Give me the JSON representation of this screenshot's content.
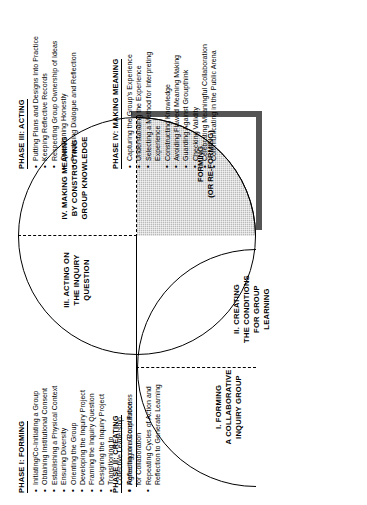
{
  "diagram": {
    "quadrants": [
      {
        "id": "q1",
        "label": "I.  FORMING\nA COLLABORATIVE\nINQUIRY GROUP"
      },
      {
        "id": "q2",
        "label": "II. CREATING\nTHE CONDITIONS\nFOR GROUP\nLEARNING"
      },
      {
        "id": "q3",
        "label": "III. ACTING ON\nTHE INQUIRY\nQUESTION"
      },
      {
        "id": "q4",
        "label": "IV.  MAKING MEANING\nBY CONSTRUCTING\nGROUP KNOWLEDGE"
      }
    ],
    "shaded_region_label": "FORMING\n(OR RE-FORMING)"
  },
  "phases": [
    {
      "id": "phase1",
      "heading": "PHASE I:  FORMING",
      "items": [
        "Initiating/Co-Initiating a Group",
        "Obtaining Institutional Consent",
        "Establishing a Physical Context",
        "Ensuring Diversity",
        "Orienting the Group",
        "Developing the Inquiry Project",
        "Framing the Inquiry Question",
        "Designing the Inquiry Project",
        "Transitioning to",
        "Collective Leadership",
        "Reflecting on Group Process"
      ],
      "continuation_indexes": [
        9
      ]
    },
    {
      "id": "phase2",
      "heading": "PHASE II:  CREATING",
      "items": [
        "Agreeing on a Constitution",
        "for Collaboration",
        "Repeating Cycles of Action and",
        "Reflection to Generate Learning"
      ],
      "continuation_indexes": [
        1,
        3
      ]
    },
    {
      "id": "phase3",
      "heading": "PHASE III:  ACTING",
      "items": [
        "Putting Plans and Designs Into Practice",
        "Keeping Reflective Records",
        "Respecting Group Ownership of Ideas",
        "Questioning Honestly",
        "Practicing Dialogue and Reflection"
      ],
      "continuation_indexes": []
    },
    {
      "id": "phase4",
      "heading": "PHASE IV:  MAKING MEANING",
      "items": [
        "Capturing the Group's Experience",
        "Understanding the Experience",
        "Selecting a Method for Interpreting",
        "Experience",
        "Constructing  Knowledge",
        "Avoiding Flawed Meaning Making",
        "Guarding Against Groupthink",
        "Checking Validity",
        "Celebrating Meaningful Collaboration",
        "Communicating in the Public Arena"
      ],
      "continuation_indexes": [
        3
      ]
    }
  ],
  "bullet_glyph": "•",
  "colors": {
    "stroke": "#000000",
    "shade_fill": "#b9b9b9",
    "shadow": "#555555",
    "background": "#ffffff"
  }
}
